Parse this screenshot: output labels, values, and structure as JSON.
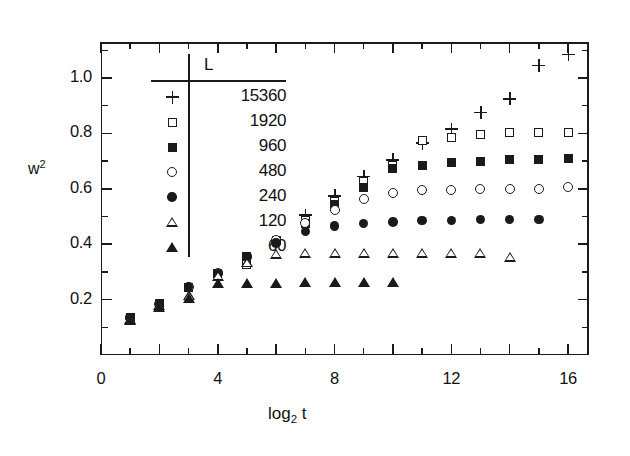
{
  "figure": {
    "background": "#ffffff",
    "ink_color": "#1a1a1a"
  },
  "axes": {
    "y_title": "w",
    "y_title_sup": "2",
    "x_title_main": "log",
    "x_title_sub": "2",
    "x_title_tail": "t",
    "y_ticks": [
      "0.2",
      "0.4",
      "0.6",
      "0.8",
      "1.0"
    ],
    "x_ticks": [
      "0",
      "4",
      "8",
      "12",
      "16"
    ]
  },
  "legend": {
    "title": "L",
    "items": [
      {
        "symbol": "plus",
        "label": "15360"
      },
      {
        "symbol": "open-square",
        "label": "1920"
      },
      {
        "symbol": "filled-square",
        "label": "960"
      },
      {
        "symbol": "open-circle",
        "label": "480"
      },
      {
        "symbol": "filled-circle",
        "label": "240"
      },
      {
        "symbol": "open-triangle",
        "label": "120"
      },
      {
        "symbol": "filled-triangle",
        "label": "60"
      }
    ]
  },
  "chart_data": {
    "type": "scatter",
    "title": "",
    "xlabel": "log2 t",
    "ylabel": "w^2",
    "xlim": [
      0,
      16.7
    ],
    "ylim": [
      0.0,
      1.13
    ],
    "grid": false,
    "legend_position": "upper-left-inset",
    "x_ticks_major": [
      0,
      4,
      8,
      12,
      16
    ],
    "x_ticks_minor_step": 1,
    "y_ticks_major": [
      0.2,
      0.4,
      0.6,
      0.8,
      1.0
    ],
    "y_ticks_minor_step": 0.1,
    "series": [
      {
        "name": "15360",
        "symbol": "plus",
        "x": [
          7,
          8,
          9,
          10,
          11,
          12,
          13,
          14,
          15,
          16
        ],
        "y": [
          0.505,
          0.575,
          0.645,
          0.705,
          0.765,
          0.815,
          0.875,
          0.925,
          1.045,
          1.085
        ]
      },
      {
        "name": "1920",
        "symbol": "open-square",
        "x": [
          1,
          2,
          3,
          4,
          5,
          6,
          7,
          8,
          9,
          10,
          11,
          12,
          13,
          14,
          15,
          16
        ],
        "y": [
          0.135,
          0.185,
          0.245,
          0.295,
          0.325,
          0.415,
          0.485,
          0.555,
          0.625,
          0.685,
          0.775,
          0.785,
          0.795,
          0.805,
          0.805,
          0.805
        ]
      },
      {
        "name": "960",
        "symbol": "filled-square",
        "x": [
          1,
          2,
          3,
          4,
          5,
          6,
          7,
          8,
          9,
          10,
          11,
          12,
          13,
          14,
          15,
          16
        ],
        "y": [
          0.135,
          0.185,
          0.245,
          0.295,
          0.355,
          0.415,
          0.475,
          0.545,
          0.605,
          0.675,
          0.685,
          0.695,
          0.7,
          0.705,
          0.705,
          0.71
        ]
      },
      {
        "name": "480",
        "symbol": "open-circle",
        "x": [
          1,
          2,
          3,
          4,
          5,
          6,
          7,
          8,
          9,
          10,
          11,
          12,
          13,
          14,
          15,
          16
        ],
        "y": [
          0.135,
          0.185,
          0.245,
          0.295,
          0.355,
          0.415,
          0.475,
          0.525,
          0.565,
          0.585,
          0.595,
          0.595,
          0.6,
          0.6,
          0.6,
          0.605
        ]
      },
      {
        "name": "240",
        "symbol": "filled-circle",
        "x": [
          1,
          2,
          3,
          4,
          5,
          6,
          7,
          8,
          9,
          10,
          11,
          12,
          13,
          14,
          15
        ],
        "y": [
          0.135,
          0.185,
          0.245,
          0.295,
          0.355,
          0.405,
          0.445,
          0.465,
          0.475,
          0.48,
          0.485,
          0.485,
          0.49,
          0.49,
          0.49
        ]
      },
      {
        "name": "120",
        "symbol": "open-triangle",
        "x": [
          1,
          2,
          3,
          4,
          5,
          6,
          7,
          8,
          9,
          10,
          11,
          12,
          13,
          14
        ],
        "y": [
          0.13,
          0.18,
          0.215,
          0.285,
          0.335,
          0.365,
          0.37,
          0.37,
          0.37,
          0.37,
          0.37,
          0.37,
          0.37,
          0.355
        ]
      },
      {
        "name": "60",
        "symbol": "filled-triangle",
        "x": [
          1,
          2,
          3,
          4,
          5,
          6,
          7,
          8,
          9,
          10
        ],
        "y": [
          0.125,
          0.175,
          0.205,
          0.26,
          0.26,
          0.26,
          0.265,
          0.265,
          0.265,
          0.265
        ]
      }
    ]
  }
}
